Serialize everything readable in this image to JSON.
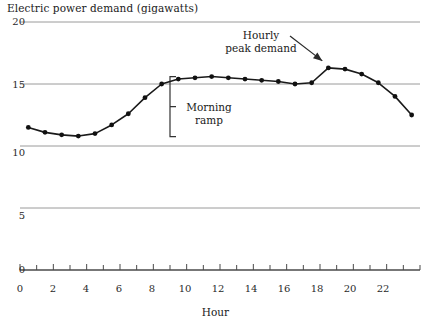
{
  "chart_data": {
    "type": "line",
    "title": "Electric power demand (gigawatts)",
    "xlabel": "Hour",
    "ylabel": "",
    "xlim": [
      0,
      24
    ],
    "ylim": [
      0,
      20
    ],
    "grid": true,
    "legend": "none",
    "marker": "filled-circle",
    "x": [
      0.5,
      1.5,
      2.5,
      3.5,
      4.5,
      5.5,
      6.5,
      7.5,
      8.5,
      9.5,
      10.5,
      11.5,
      12.5,
      13.5,
      14.5,
      15.5,
      16.5,
      17.5,
      18.5,
      19.5,
      20.5,
      21.5,
      22.5,
      23.5
    ],
    "values": [
      11.5,
      11.1,
      10.9,
      10.8,
      11.0,
      11.7,
      12.6,
      13.9,
      15.0,
      15.4,
      15.5,
      15.6,
      15.5,
      15.4,
      15.3,
      15.2,
      15.0,
      15.1,
      16.3,
      16.2,
      15.8,
      15.1,
      14.0,
      12.5
    ],
    "xticks": [
      0,
      2,
      4,
      6,
      8,
      10,
      12,
      14,
      16,
      18,
      20,
      22
    ],
    "xtick_labels": [
      "0",
      "2",
      "4",
      "6",
      "8",
      "10",
      "12",
      "14",
      "16",
      "18",
      "20",
      "22"
    ],
    "yticks": [
      0,
      5,
      10,
      15,
      20
    ],
    "ytick_labels": [
      "0",
      "5",
      "10",
      "15",
      "20"
    ],
    "minor_xtick_interval": 1,
    "annotations": [
      {
        "id": "peak",
        "text_line1": "Hourly",
        "text_line2": "peak demand",
        "target_x": 18.5,
        "target_y": 16.3,
        "arrow": true
      },
      {
        "id": "ramp",
        "text_line1": "Morning",
        "text_line2": "ramp",
        "bracket_x": 9.0,
        "bracket_y_low": 10.75,
        "bracket_y_high": 15.6
      }
    ],
    "colors": {
      "line": "#1a1a1a",
      "marker": "#111111",
      "grid": "#9a9a9a",
      "axis": "#4a4a4a",
      "text": "#1a1a1a",
      "background": "#ffffff"
    }
  }
}
